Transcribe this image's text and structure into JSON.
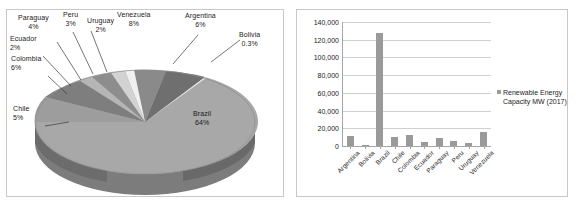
{
  "chart_data": [
    {
      "type": "pie",
      "title": "",
      "legend_position": "none",
      "grid": false,
      "unit": "percent",
      "categories": [
        "Argentina",
        "Bolivia",
        "Brazil",
        "Chile",
        "Colombia",
        "Ecuador",
        "Paraguay",
        "Peru",
        "Uruguay",
        "Venezuela"
      ],
      "values": [
        6,
        0.3,
        64,
        5,
        6,
        2,
        4,
        3,
        2,
        8
      ],
      "labels": [
        {
          "name": "Paraguay",
          "value": "4%",
          "x": 11,
          "y": 4
        },
        {
          "name": "Peru",
          "value": "3%",
          "x": 60,
          "y": 2
        },
        {
          "name": "Uruguay",
          "value": "2%",
          "x": 87,
          "y": 6
        },
        {
          "name": "Venezuela",
          "value": "8%",
          "x": 130,
          "y": 1
        },
        {
          "name": "Argentina",
          "value": "6%",
          "x": 194,
          "y": 2
        },
        {
          "name": "Bolivia",
          "value": "0.3%",
          "x": 235,
          "y": 20
        },
        {
          "name": "Ecuador",
          "value": "2%",
          "x": 2,
          "y": 23
        },
        {
          "name": "Colombia",
          "value": "6%",
          "x": 3,
          "y": 43
        },
        {
          "name": "Chile",
          "value": "5%",
          "x": 6,
          "y": 92
        },
        {
          "name": "Brazil",
          "value": "64%",
          "x": 188,
          "y": 99
        }
      ],
      "slice_colors": [
        "#6f6f6f",
        "#e8e8e8",
        "#a8a8a8",
        "#9d9d9d",
        "#7e7e7e",
        "#b5b5b5",
        "#8d8d8d",
        "#d2d2d2",
        "#f0f0f0",
        "#8a8a8a"
      ]
    },
    {
      "type": "bar",
      "title": "",
      "xlabel": "",
      "ylabel": "",
      "grid": true,
      "legend_position": "right",
      "series_name": "Renewable Energy Capacity MW (2017)",
      "series_color": "#9a9a9a",
      "categories": [
        "Argentina",
        "Bolivia",
        "Brazil",
        "Chile",
        "Colombia",
        "Ecuador",
        "Paraguay",
        "Peru",
        "Uruguay",
        "Venezuela"
      ],
      "values": [
        11000,
        600,
        128000,
        10500,
        12000,
        5000,
        8500,
        6000,
        3500,
        15500
      ],
      "ylim": [
        0,
        140000
      ],
      "ytick_labels": [
        "140,000",
        "120,000",
        "100,000",
        "80,000",
        "60,000",
        "40,000",
        "20,000",
        "0"
      ],
      "ytick_values": [
        140000,
        120000,
        100000,
        80000,
        60000,
        40000,
        20000,
        0
      ]
    }
  ],
  "pie": {
    "panel_name": "pie-chart-panel"
  },
  "bar": {
    "panel_name": "bar-chart-panel",
    "legend_label": "Renewable Energy Capacity MW (2017)"
  }
}
